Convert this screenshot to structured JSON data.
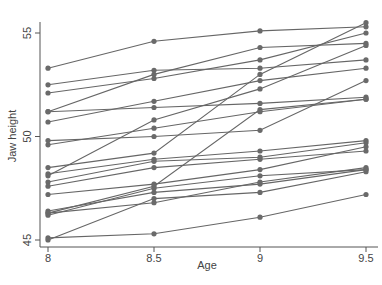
{
  "chart_data": {
    "type": "line",
    "title": "",
    "xlabel": "Age",
    "ylabel": "Jaw height",
    "x": [
      8,
      8.5,
      9,
      9.5
    ],
    "xticks": [
      "8",
      "8.5",
      "9",
      "9.5"
    ],
    "yticks": [
      "45",
      "50",
      "55"
    ],
    "xlim": [
      8,
      9.5
    ],
    "ylim": [
      44.7,
      55.7
    ],
    "grid": false,
    "legend": "none",
    "line_color": "#666666",
    "background": "#ffffff",
    "series": [
      {
        "name": "1",
        "values": [
          47.8,
          48.8,
          49.0,
          49.7
        ]
      },
      {
        "name": "2",
        "values": [
          46.4,
          47.3,
          47.7,
          48.4
        ]
      },
      {
        "name": "3",
        "values": [
          46.3,
          46.8,
          47.8,
          48.5
        ]
      },
      {
        "name": "4",
        "values": [
          45.1,
          45.3,
          46.1,
          47.2
        ]
      },
      {
        "name": "5",
        "values": [
          47.6,
          48.5,
          48.9,
          49.3
        ]
      },
      {
        "name": "6",
        "values": [
          52.5,
          53.2,
          53.3,
          53.7
        ]
      },
      {
        "name": "7",
        "values": [
          51.2,
          53.0,
          54.3,
          54.5
        ]
      },
      {
        "name": "8",
        "values": [
          49.8,
          50.0,
          50.3,
          52.7
        ]
      },
      {
        "name": "9",
        "values": [
          48.1,
          50.8,
          52.3,
          54.4
        ]
      },
      {
        "name": "10",
        "values": [
          45.0,
          47.0,
          47.3,
          48.3
        ]
      },
      {
        "name": "11",
        "values": [
          51.2,
          51.4,
          51.6,
          51.9
        ]
      },
      {
        "name": "12",
        "values": [
          48.5,
          49.2,
          53.0,
          55.5
        ]
      },
      {
        "name": "13",
        "values": [
          52.1,
          52.8,
          53.7,
          55.0
        ]
      },
      {
        "name": "14",
        "values": [
          48.2,
          48.9,
          49.3,
          49.8
        ]
      },
      {
        "name": "15",
        "values": [
          49.6,
          50.4,
          51.2,
          51.8
        ]
      },
      {
        "name": "16",
        "values": [
          50.7,
          51.7,
          52.7,
          53.3
        ]
      },
      {
        "name": "17",
        "values": [
          47.2,
          47.7,
          48.4,
          49.5
        ]
      },
      {
        "name": "18",
        "values": [
          53.3,
          54.6,
          55.1,
          55.3
        ]
      },
      {
        "name": "19",
        "values": [
          46.2,
          47.5,
          48.1,
          48.4
        ]
      },
      {
        "name": "20",
        "values": [
          46.3,
          47.6,
          51.3,
          51.8
        ]
      }
    ]
  }
}
